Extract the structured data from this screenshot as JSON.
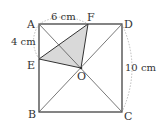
{
  "diagram": {
    "type": "geometry-square",
    "points": {
      "A": {
        "label": "A",
        "x": 39,
        "y": 24
      },
      "D": {
        "label": "D",
        "x": 122,
        "y": 24
      },
      "B": {
        "label": "B",
        "x": 39,
        "y": 112
      },
      "C": {
        "label": "C",
        "x": 122,
        "y": 112
      },
      "O": {
        "label": "O",
        "x": 81,
        "y": 68
      },
      "F": {
        "label": "F",
        "x": 88,
        "y": 24
      },
      "E": {
        "label": "E",
        "x": 39,
        "y": 59
      }
    },
    "measures": {
      "af": "6 cm",
      "ae": "4 cm",
      "dc": "10 cm"
    },
    "colors": {
      "stroke": "#333333",
      "shade": "#d9d9d9",
      "dotted": "#999999"
    }
  }
}
